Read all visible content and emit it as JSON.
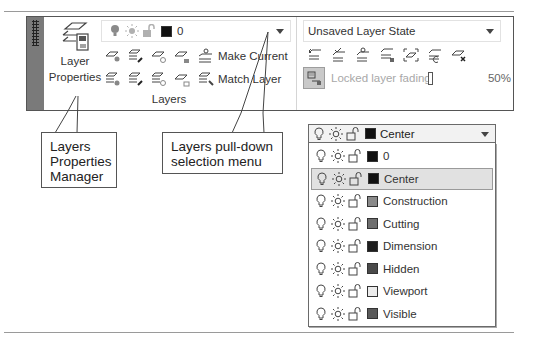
{
  "ribbon": {
    "layer_properties_button": {
      "line1": "Layer",
      "line2": "Properties"
    },
    "current_layer_dropdown": {
      "value": "0",
      "swatch_color": "#111111"
    },
    "row1_text_button": "Make Current",
    "row2_text_button": "Match Layer",
    "panel_title": "Layers",
    "layer_state_dropdown": {
      "value": "Unsaved Layer State"
    },
    "locked_layer_fading": {
      "label": "Locked layer fading",
      "value": "50%"
    }
  },
  "callouts": {
    "layers_properties_manager": [
      "Layers",
      "Properties",
      "Manager"
    ],
    "layers_pulldown": [
      "Layers pull-down",
      "selection menu"
    ]
  },
  "layer_dropdown_expanded": {
    "selected": {
      "name": "Center",
      "color": "#111111"
    },
    "items": [
      {
        "name": "0",
        "color": "#111111",
        "selected": false
      },
      {
        "name": "Center",
        "color": "#111111",
        "selected": true
      },
      {
        "name": "Construction",
        "color": "#8a8a8a",
        "selected": false
      },
      {
        "name": "Cutting",
        "color": "#6e6e6e",
        "selected": false
      },
      {
        "name": "Dimension",
        "color": "#1e1e1e",
        "selected": false
      },
      {
        "name": "Hidden",
        "color": "#4a4a4a",
        "selected": false
      },
      {
        "name": "Viewport",
        "color": "#ececec",
        "selected": false
      },
      {
        "name": "Visible",
        "color": "#5a5a5a",
        "selected": false
      }
    ]
  }
}
